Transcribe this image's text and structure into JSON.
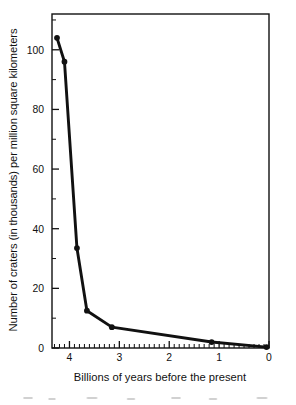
{
  "chart_data": {
    "type": "line",
    "title": "",
    "xlabel": "Billions of years before the present",
    "ylabel": "Number of craters (in thousands) per million square kilometers",
    "xlim": [
      4.35,
      0
    ],
    "ylim": [
      0,
      112
    ],
    "x_axis_reversed": true,
    "grid": false,
    "legend": null,
    "xticks": [
      4,
      3,
      2,
      1,
      0
    ],
    "xtick_labels": [
      "4",
      "3",
      "2",
      "1",
      "0"
    ],
    "xminor_tick_interval": 0.1,
    "yticks": [
      0,
      20,
      40,
      60,
      80,
      100
    ],
    "ytick_labels": [
      "0",
      "20",
      "40",
      "60",
      "80",
      "100"
    ],
    "yminor_tick_interval": 10,
    "series": [
      {
        "name": "Crater density",
        "color": "#111111",
        "marker": "filled-circle",
        "x": [
          4.25,
          4.1,
          3.85,
          3.65,
          3.15,
          1.15,
          0.05
        ],
        "y": [
          104,
          96,
          33.5,
          12.5,
          7,
          2,
          0.3
        ]
      }
    ],
    "annotations": []
  },
  "axis_styles": {
    "frame_color": "#111111",
    "line_color": "#111111",
    "background": "#ffffff"
  }
}
